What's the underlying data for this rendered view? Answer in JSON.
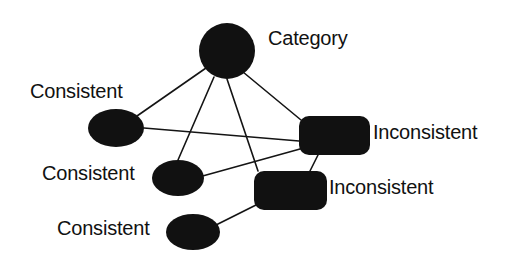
{
  "diagram": {
    "background_color": "#ffffff",
    "ink_color": "#111111",
    "labels": {
      "category": "Category",
      "consistent_1": "Consistent",
      "consistent_2": "Consistent",
      "consistent_3": "Consistent",
      "inconsistent_1": "Inconsistent",
      "inconsistent_2": "Inconsistent"
    },
    "nodes": [
      {
        "id": "category",
        "label": "Category",
        "shape": "circle",
        "cx": 227,
        "cy": 51,
        "rx": 28,
        "ry": 28,
        "label_x": 268,
        "label_y": 28
      },
      {
        "id": "consistent_1",
        "label": "Consistent",
        "shape": "ellipse",
        "cx": 116,
        "cy": 128,
        "rx": 28,
        "ry": 19,
        "label_x": 30,
        "label_y": 81
      },
      {
        "id": "consistent_2",
        "label": "Consistent",
        "shape": "ellipse",
        "cx": 178,
        "cy": 178,
        "rx": 26,
        "ry": 18,
        "label_x": 42,
        "label_y": 163
      },
      {
        "id": "consistent_3",
        "label": "Consistent",
        "shape": "ellipse",
        "cx": 193,
        "cy": 232,
        "rx": 27,
        "ry": 18,
        "label_x": 57,
        "label_y": 218
      },
      {
        "id": "inconsistent_1",
        "label": "Inconsistent",
        "shape": "rounded-rect",
        "x": 299,
        "y": 116,
        "width": 71,
        "height": 39,
        "radius": 10,
        "label_x": 373,
        "label_y": 122
      },
      {
        "id": "inconsistent_2",
        "label": "Inconsistent",
        "shape": "rounded-rect",
        "x": 254,
        "y": 171,
        "width": 73,
        "height": 39,
        "radius": 10,
        "label_x": 329,
        "label_y": 177
      }
    ],
    "edges": [
      {
        "id": "edge-category-consistent1",
        "from": "category",
        "to": "consistent_1",
        "x1": 206,
        "y1": 68,
        "x2": 137,
        "y2": 116
      },
      {
        "id": "edge-category-consistent2",
        "from": "category",
        "to": "consistent_2",
        "x1": 214,
        "y1": 77,
        "x2": 178,
        "y2": 160
      },
      {
        "id": "edge-category-inconsistent2",
        "from": "category",
        "to": "inconsistent_2",
        "x1": 227,
        "y1": 79,
        "x2": 258,
        "y2": 171
      },
      {
        "id": "edge-category-inconsistent1",
        "from": "category",
        "to": "inconsistent_1",
        "x1": 243,
        "y1": 72,
        "x2": 301,
        "y2": 120
      },
      {
        "id": "edge-consistent1-inconsistent1",
        "from": "consistent_1",
        "to": "inconsistent_1",
        "x1": 144,
        "y1": 128,
        "x2": 299,
        "y2": 141
      },
      {
        "id": "edge-consistent2-inconsistent1",
        "from": "consistent_2",
        "to": "inconsistent_1",
        "x1": 181,
        "y1": 182,
        "x2": 300,
        "y2": 149
      },
      {
        "id": "edge-consistent3-inconsistent2",
        "from": "consistent_3",
        "to": "inconsistent_2",
        "x1": 216,
        "y1": 225,
        "x2": 256,
        "y2": 205
      },
      {
        "id": "edge-inconsistent1-inconsistent2",
        "from": "inconsistent_1",
        "to": "inconsistent_2",
        "x1": 318,
        "y1": 155,
        "x2": 310,
        "y2": 171
      }
    ]
  }
}
